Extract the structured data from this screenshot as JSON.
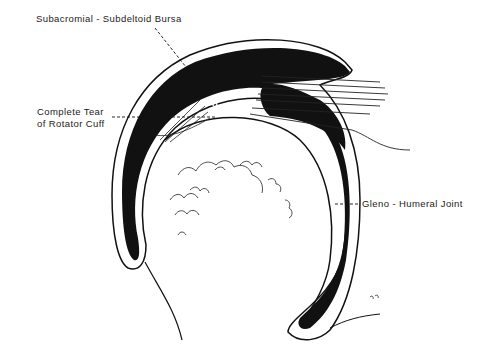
{
  "diagram": {
    "labels": {
      "bursa": "Subacromial - Subdeltoid Bursa",
      "tear_line1": "Complete Tear",
      "tear_line2": "of Rotator Cuff",
      "joint": "Gleno - Humeral Joint",
      "marker": "o"
    },
    "colors": {
      "ink": "#111111",
      "background": "#ffffff"
    }
  }
}
